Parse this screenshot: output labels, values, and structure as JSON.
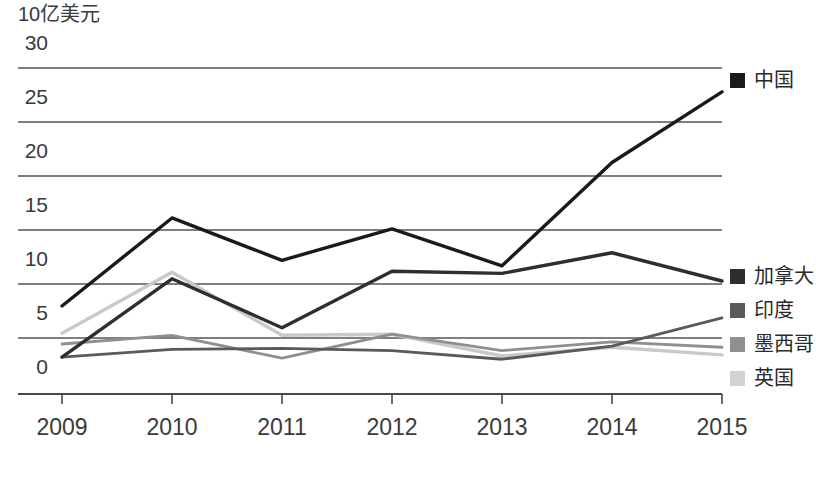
{
  "chart_data": {
    "type": "line",
    "title": "",
    "subtitle": "",
    "xlabel": "",
    "ylabel": "10亿美元",
    "unit_label": "10亿美元",
    "x": [
      "2009",
      "2010",
      "2011",
      "2012",
      "2013",
      "2014",
      "2015"
    ],
    "categories": [
      "2009",
      "2010",
      "2011",
      "2012",
      "2013",
      "2014",
      "2015"
    ],
    "xlim": [
      "2009",
      "2015"
    ],
    "ylim": [
      0,
      30
    ],
    "yticks": [
      0,
      5,
      10,
      15,
      20,
      25,
      30
    ],
    "ytick_labels": [
      "0",
      "5",
      "10",
      "15",
      "20",
      "25",
      "30"
    ],
    "grid": true,
    "grid_axis": "y",
    "legend_position": "right",
    "series": [
      {
        "name": "中国",
        "color": "#1a1a1a",
        "values": [
          8.1,
          16.2,
          12.3,
          15.2,
          11.8,
          21.3,
          27.8
        ]
      },
      {
        "name": "加拿大",
        "color": "#2e2e2e",
        "values": [
          3.4,
          10.6,
          6.1,
          11.3,
          11.1,
          13.0,
          10.4
        ]
      },
      {
        "name": "印度",
        "color": "#5a5a5a",
        "values": [
          3.4,
          4.1,
          4.2,
          4.0,
          3.2,
          4.4,
          7.0
        ]
      },
      {
        "name": "墨西哥",
        "color": "#8f8f8f",
        "values": [
          4.6,
          5.4,
          3.3,
          5.5,
          4.0,
          4.8,
          4.3
        ]
      },
      {
        "name": "英国",
        "color": "#c9c9c9",
        "values": [
          5.6,
          11.2,
          5.4,
          5.5,
          3.5,
          4.3,
          3.6
        ]
      }
    ]
  },
  "axis": {
    "unit_label": "10亿美元",
    "y_ticks": [
      "30",
      "25",
      "20",
      "15",
      "10",
      "5",
      "0"
    ],
    "x_ticks": [
      "2009",
      "2010",
      "2011",
      "2012",
      "2013",
      "2014",
      "2015"
    ]
  },
  "legend": {
    "top_group": [
      {
        "label": "中国",
        "color": "#1a1a1a"
      }
    ],
    "bottom_group": [
      {
        "label": "加拿大",
        "color": "#2e2e2e"
      },
      {
        "label": "印度",
        "color": "#5a5a5a"
      },
      {
        "label": "墨西哥",
        "color": "#8f8f8f"
      },
      {
        "label": "英国",
        "color": "#d2d2d2"
      }
    ]
  },
  "caption": {
    "text": ""
  },
  "colors": {
    "axis": "#4a4a4a",
    "grid": "#5a5a5a",
    "text": "#2b2b2b",
    "background": "#ffffff"
  }
}
